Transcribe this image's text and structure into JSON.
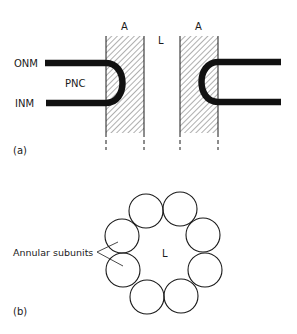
{
  "panel_a": {
    "label": "(a)",
    "labels": {
      "outer_membrane": "ONM",
      "inner_membrane": "INM",
      "perinuclear_cisterna": "PNC",
      "annulus_left": "A",
      "annulus_right": "A",
      "lumen": "L"
    }
  },
  "panel_b": {
    "label": "(b)",
    "labels": {
      "annular_subunits": "Annular subunits",
      "lumen": "L"
    },
    "subunit_count": 8
  },
  "colors": {
    "ink": "#1a1a1a",
    "hatch": "#6b6b6b",
    "background": "#ffffff"
  }
}
